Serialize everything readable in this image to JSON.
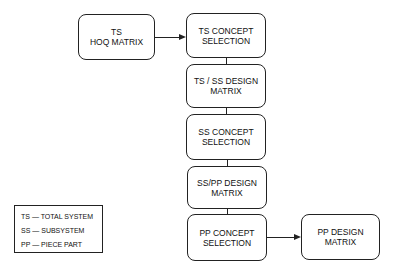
{
  "diagram": {
    "type": "flowchart",
    "nodes": [
      {
        "id": "ts-hoq",
        "lines": [
          "TS",
          "HOQ MATRIX"
        ]
      },
      {
        "id": "ts-concept",
        "lines": [
          "TS CONCEPT",
          "SELECTION"
        ]
      },
      {
        "id": "ts-ss-design",
        "lines": [
          "TS / SS DESIGN",
          "MATRIX"
        ]
      },
      {
        "id": "ss-concept",
        "lines": [
          "SS CONCEPT",
          "SELECTION"
        ]
      },
      {
        "id": "ss-pp-design",
        "lines": [
          "SS/PP DESIGN",
          "MATRIX"
        ]
      },
      {
        "id": "pp-concept",
        "lines": [
          "PP CONCEPT",
          "SELECTION"
        ]
      },
      {
        "id": "pp-design",
        "lines": [
          "PP DESIGN",
          "MATRIX"
        ]
      }
    ],
    "edges": [
      {
        "from": "ts-hoq",
        "to": "ts-concept",
        "arrow": true
      },
      {
        "from": "ts-concept",
        "to": "ts-ss-design",
        "arrow": false
      },
      {
        "from": "ts-ss-design",
        "to": "ss-concept",
        "arrow": false
      },
      {
        "from": "ss-concept",
        "to": "ss-pp-design",
        "arrow": false
      },
      {
        "from": "ss-pp-design",
        "to": "pp-concept",
        "arrow": false
      },
      {
        "from": "pp-concept",
        "to": "pp-design",
        "arrow": true
      }
    ],
    "legend": [
      "TS  — TOTAL SYSTEM",
      "SS — SUBSYSTEM",
      "PP — PIECE PART"
    ]
  }
}
